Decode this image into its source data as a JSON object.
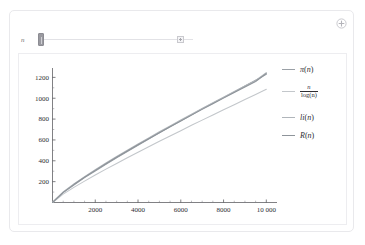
{
  "panel": {
    "expand_icon": "circle-plus-icon"
  },
  "controls": {
    "slider": {
      "label": "n",
      "value": 10000,
      "min": 10,
      "max": 100000,
      "handle_position_pct": 0,
      "expand_button_icon": "plus-square-icon"
    }
  },
  "legend": {
    "entries": [
      {
        "name": "pi",
        "label": "π(n)",
        "color": "#9aa0a6",
        "kind": "text"
      },
      {
        "name": "n-over-log-n",
        "numerator": "n",
        "denominator": "log(n)",
        "color": "#c3c7cb",
        "kind": "fraction"
      },
      {
        "name": "li",
        "label": "li(n)",
        "color": "#b0b5ba",
        "kind": "text"
      },
      {
        "name": "R",
        "label": "R(n)",
        "color": "#8e949a",
        "kind": "text"
      }
    ]
  },
  "chart_data": {
    "type": "line",
    "title": "",
    "xlabel": "",
    "ylabel": "",
    "xlim": [
      0,
      10500
    ],
    "ylim": [
      0,
      1290
    ],
    "xticks": [
      2000,
      4000,
      6000,
      8000,
      10000
    ],
    "xticklabels": [
      "2000",
      "4000",
      "6000",
      "8000",
      "10 000"
    ],
    "yticks": [
      200,
      400,
      600,
      800,
      1000,
      1200
    ],
    "yticklabels": [
      "200",
      "400",
      "600",
      "800",
      "1000",
      "1200"
    ],
    "grid": false,
    "legend_position": "right",
    "x": [
      0,
      500,
      1000,
      1500,
      2000,
      2500,
      3000,
      3500,
      4000,
      4500,
      5000,
      5500,
      6000,
      6500,
      7000,
      7500,
      8000,
      8500,
      9000,
      9500,
      10000
    ],
    "series": [
      {
        "name": "π(n)",
        "color": "#9aa0a6",
        "values": [
          0,
          95,
          168,
          239,
          303,
          367,
          430,
          489,
          550,
          609,
          669,
          726,
          783,
          839,
          900,
          951,
          1007,
          1060,
          1117,
          1173,
          1229
        ]
      },
      {
        "name": "n/log(n)",
        "color": "#c3c7cb",
        "values": [
          0,
          80,
          145,
          205,
          263,
          320,
          375,
          429,
          482,
          535,
          587,
          638,
          689,
          740,
          790,
          840,
          889,
          938,
          987,
          1036,
          1085
        ]
      },
      {
        "name": "li(n)",
        "color": "#b0b5ba",
        "values": [
          0,
          101,
          177,
          248,
          314,
          378,
          441,
          501,
          561,
          620,
          678,
          735,
          791,
          847,
          902,
          956,
          1010,
          1064,
          1117,
          1170,
          1246
        ]
      },
      {
        "name": "R(n)",
        "color": "#8e949a",
        "values": [
          0,
          97,
          172,
          242,
          308,
          372,
          434,
          494,
          553,
          612,
          669,
          726,
          782,
          838,
          893,
          947,
          1001,
          1055,
          1108,
          1161,
          1237
        ]
      }
    ]
  }
}
